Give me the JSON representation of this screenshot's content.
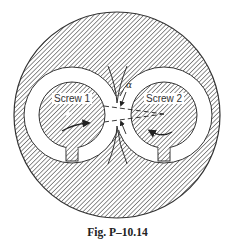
{
  "figure": {
    "caption": "Fig. P–10.14",
    "screw1": {
      "label": "Screw 1",
      "rotation": "clockwise"
    },
    "screw2": {
      "label": "Screw 2",
      "rotation": "counter-clockwise"
    },
    "angle_label": "α"
  },
  "colors": {
    "hatch": "#555555",
    "outline": "#333333",
    "background": "#ffffff"
  }
}
